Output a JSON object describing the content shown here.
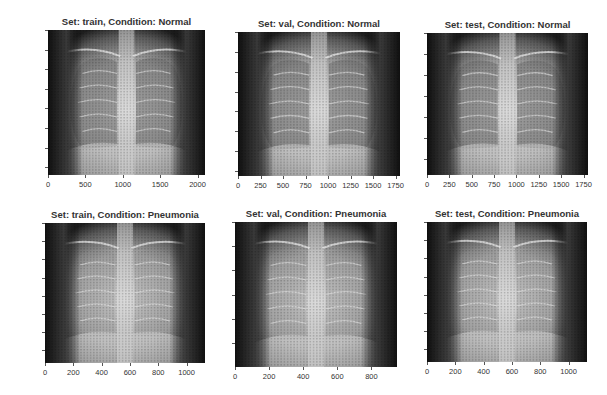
{
  "chart_data": [
    {
      "type": "heatmap",
      "title": "Set: train, Condition: Normal",
      "subject": "chest x-ray image",
      "xlim": [
        0,
        2100
      ],
      "ylim": [
        1850,
        0
      ],
      "xticks": [
        "0",
        "500",
        "1000",
        "1500",
        "2000"
      ],
      "xtick_values": [
        0,
        500,
        1000,
        1500,
        2000
      ],
      "yticks": [
        "0",
        "250",
        "500",
        "750",
        "1000",
        "1250",
        "1500",
        "1750"
      ],
      "ytick_values": [
        0,
        250,
        500,
        750,
        1000,
        1250,
        1500,
        1750
      ],
      "grid": false
    },
    {
      "type": "heatmap",
      "title": "Set: val, Condition: Normal",
      "subject": "chest x-ray image",
      "xlim": [
        0,
        1800
      ],
      "ylim": [
        1450,
        0
      ],
      "xticks": [
        "0",
        "250",
        "500",
        "750",
        "1000",
        "1250",
        "1500",
        "1750"
      ],
      "xtick_values": [
        0,
        250,
        500,
        750,
        1000,
        1250,
        1500,
        1750
      ],
      "yticks": [
        "0",
        "200",
        "400",
        "600",
        "800",
        "1000",
        "1200",
        "1400"
      ],
      "ytick_values": [
        0,
        200,
        400,
        600,
        800,
        1000,
        1200,
        1400
      ],
      "grid": false
    },
    {
      "type": "heatmap",
      "title": "Set: test, Condition: Normal",
      "subject": "chest x-ray image",
      "xlim": [
        0,
        1800
      ],
      "ylim": [
        1350,
        0
      ],
      "xticks": [
        "0",
        "250",
        "500",
        "750",
        "1000",
        "1250",
        "1500",
        "1750"
      ],
      "xtick_values": [
        0,
        250,
        500,
        750,
        1000,
        1250,
        1500,
        1750
      ],
      "yticks": [
        "0",
        "200",
        "400",
        "600",
        "800",
        "1000",
        "1200"
      ],
      "ytick_values": [
        0,
        200,
        400,
        600,
        800,
        1000,
        1200
      ],
      "grid": false
    },
    {
      "type": "heatmap",
      "title": "Set: train, Condition: Pneumonia",
      "subject": "chest x-ray image",
      "xlim": [
        0,
        1130
      ],
      "ylim": [
        770,
        0
      ],
      "xticks": [
        "0",
        "200",
        "400",
        "600",
        "800",
        "1000"
      ],
      "xtick_values": [
        0,
        200,
        400,
        600,
        800,
        1000
      ],
      "yticks": [
        "0",
        "100",
        "200",
        "300",
        "400",
        "500",
        "600",
        "700"
      ],
      "ytick_values": [
        0,
        100,
        200,
        300,
        400,
        500,
        600,
        700
      ],
      "grid": false
    },
    {
      "type": "heatmap",
      "title": "Set: val, Condition: Pneumonia",
      "subject": "chest x-ray image",
      "xlim": [
        0,
        950
      ],
      "ylim": [
        600,
        0
      ],
      "xticks": [
        "0",
        "200",
        "400",
        "600",
        "800"
      ],
      "xtick_values": [
        0,
        200,
        400,
        600,
        800
      ],
      "yticks": [
        "0",
        "100",
        "200",
        "300",
        "400",
        "500"
      ],
      "ytick_values": [
        0,
        100,
        200,
        300,
        400,
        500
      ],
      "grid": false
    },
    {
      "type": "heatmap",
      "title": "Set: test, Condition: Pneumonia",
      "subject": "chest x-ray image",
      "xlim": [
        0,
        1130
      ],
      "ylim": [
        770,
        0
      ],
      "xticks": [
        "0",
        "200",
        "400",
        "600",
        "800",
        "1000"
      ],
      "xtick_values": [
        0,
        200,
        400,
        600,
        800,
        1000
      ],
      "yticks": [
        "0",
        "100",
        "200",
        "300",
        "400",
        "500",
        "600",
        "700"
      ],
      "ytick_values": [
        0,
        100,
        200,
        300,
        400,
        500,
        600,
        700
      ],
      "grid": false
    }
  ],
  "layout": {
    "panels": [
      {
        "x": 48,
        "y": 30,
        "w": 157,
        "h": 145
      },
      {
        "x": 238,
        "y": 32,
        "w": 162,
        "h": 144
      },
      {
        "x": 427,
        "y": 33,
        "w": 161,
        "h": 142
      },
      {
        "x": 45,
        "y": 223,
        "w": 160,
        "h": 140
      },
      {
        "x": 235,
        "y": 222,
        "w": 162,
        "h": 145
      },
      {
        "x": 427,
        "y": 222,
        "w": 160,
        "h": 140
      }
    ]
  }
}
